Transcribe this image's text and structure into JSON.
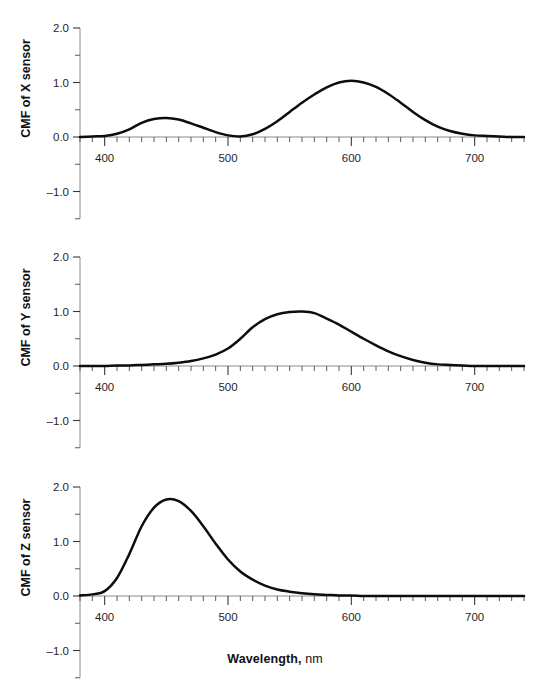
{
  "figure": {
    "xlabel_main": "Wavelength,",
    "xlabel_unit": "nm"
  },
  "chart_data": {
    "type": "line",
    "title": "",
    "subtitle": "",
    "xlabel": "Wavelength, nm",
    "grid": false,
    "legend": "none",
    "layout": "three stacked panels sharing the same x axis",
    "xlim": [
      380,
      740
    ],
    "xticks_major": [
      400,
      500,
      600,
      700
    ],
    "xticks_minor_step": 10,
    "xtick_labels": [
      "400",
      "500",
      "600",
      "700"
    ],
    "panels": [
      {
        "ylabel": "CMF of X sensor",
        "ylim": [
          -1.5,
          2.0
        ],
        "yticks_major": [
          -1.0,
          0.0,
          1.0,
          2.0
        ],
        "yticks_minor": [
          -1.5,
          -0.5,
          0.5,
          1.5
        ],
        "ytick_labels": [
          "-1.0",
          "0.0",
          "1.0",
          "2.0"
        ],
        "series_name": "x_bar",
        "peaks": [
          {
            "x": 445,
            "y": 0.35
          },
          {
            "x": 600,
            "y": 1.03
          }
        ],
        "x": [
          380,
          390,
          400,
          410,
          420,
          430,
          440,
          450,
          460,
          470,
          480,
          490,
          500,
          510,
          520,
          530,
          540,
          550,
          560,
          570,
          580,
          590,
          600,
          610,
          620,
          630,
          640,
          650,
          660,
          670,
          680,
          690,
          700,
          710,
          720,
          730,
          740
        ],
        "y": [
          0.0,
          0.01,
          0.02,
          0.06,
          0.14,
          0.26,
          0.33,
          0.35,
          0.32,
          0.25,
          0.17,
          0.09,
          0.03,
          0.01,
          0.05,
          0.15,
          0.29,
          0.46,
          0.63,
          0.78,
          0.91,
          1.0,
          1.03,
          1.0,
          0.92,
          0.79,
          0.63,
          0.46,
          0.31,
          0.19,
          0.11,
          0.06,
          0.03,
          0.02,
          0.01,
          0.0,
          0.0
        ]
      },
      {
        "ylabel": "CMF of Y sensor",
        "ylim": [
          -1.5,
          2.0
        ],
        "yticks_major": [
          -1.0,
          0.0,
          1.0,
          2.0
        ],
        "yticks_minor": [
          -1.5,
          -0.5,
          0.5,
          1.5
        ],
        "ytick_labels": [
          "-1.0",
          "0.0",
          "1.0",
          "2.0"
        ],
        "series_name": "y_bar",
        "peaks": [
          {
            "x": 555,
            "y": 1.0
          }
        ],
        "x": [
          380,
          390,
          400,
          410,
          420,
          430,
          440,
          450,
          460,
          470,
          480,
          490,
          500,
          510,
          520,
          530,
          540,
          550,
          560,
          570,
          580,
          590,
          600,
          610,
          620,
          630,
          640,
          650,
          660,
          670,
          680,
          690,
          700,
          710,
          720,
          730,
          740
        ],
        "y": [
          0.0,
          0.0,
          0.0,
          0.01,
          0.01,
          0.02,
          0.03,
          0.04,
          0.06,
          0.09,
          0.14,
          0.21,
          0.32,
          0.5,
          0.71,
          0.86,
          0.95,
          0.99,
          1.0,
          0.97,
          0.87,
          0.76,
          0.63,
          0.5,
          0.38,
          0.27,
          0.18,
          0.11,
          0.06,
          0.03,
          0.02,
          0.01,
          0.0,
          0.0,
          0.0,
          0.0,
          0.0
        ]
      },
      {
        "ylabel": "CMF of Z sensor",
        "ylim": [
          -1.5,
          2.0
        ],
        "yticks_major": [
          -1.0,
          0.0,
          1.0,
          2.0
        ],
        "yticks_minor": [
          -1.5,
          -0.5,
          0.5,
          1.5
        ],
        "ytick_labels": [
          "-1.0",
          "0.0",
          "1.0",
          "2.0"
        ],
        "series_name": "z_bar",
        "peaks": [
          {
            "x": 447,
            "y": 1.77
          }
        ],
        "x": [
          380,
          390,
          400,
          410,
          420,
          430,
          440,
          450,
          460,
          470,
          480,
          490,
          500,
          510,
          520,
          530,
          540,
          550,
          560,
          570,
          580,
          590,
          600,
          610,
          620,
          630,
          640,
          650,
          660,
          670,
          680,
          690,
          700,
          710,
          720,
          730,
          740
        ],
        "y": [
          0.01,
          0.03,
          0.09,
          0.33,
          0.77,
          1.28,
          1.62,
          1.77,
          1.74,
          1.56,
          1.28,
          0.96,
          0.67,
          0.45,
          0.3,
          0.19,
          0.12,
          0.08,
          0.05,
          0.03,
          0.02,
          0.01,
          0.01,
          0.0,
          0.0,
          0.0,
          0.0,
          0.0,
          0.0,
          0.0,
          0.0,
          0.0,
          0.0,
          0.0,
          0.0,
          0.0,
          0.0
        ]
      }
    ]
  },
  "colors": {
    "curve": "#0d0d0d",
    "axis": "#2b2b2b",
    "tick": "#5a5a5a",
    "text": "#1a1a1a",
    "background": "#ffffff"
  }
}
